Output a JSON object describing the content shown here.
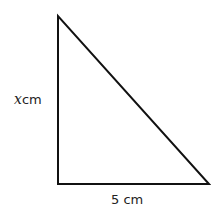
{
  "diagram": {
    "type": "right-triangle",
    "vertices": {
      "top": [
        58,
        16
      ],
      "bottom_left": [
        58,
        184
      ],
      "bottom_right": [
        209,
        184
      ]
    },
    "stroke_color": "#111111",
    "labels": {
      "height_var": "x",
      "height_unit": "cm",
      "base": "5 cm"
    }
  }
}
